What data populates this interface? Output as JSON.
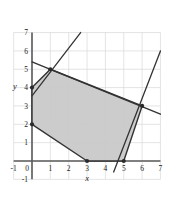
{
  "chart_data": {
    "type": "scatter",
    "title": "",
    "xlabel": "x",
    "ylabel": "y",
    "xlim": [
      -1,
      7
    ],
    "ylim": [
      -1,
      7
    ],
    "xticks": [
      -1,
      0,
      1,
      2,
      3,
      4,
      5,
      6,
      7
    ],
    "yticks": [
      -1,
      0,
      1,
      2,
      3,
      4,
      5,
      6,
      7
    ],
    "xtick_labels": [
      "-1",
      "0",
      "1",
      "2",
      "3",
      "4",
      "5",
      "6",
      "7"
    ],
    "ytick_labels": [
      "-1",
      "0",
      "1",
      "2",
      "3",
      "4",
      "5",
      "6",
      "7"
    ],
    "grid": true,
    "legend": "none",
    "shaded_region": {
      "name": "feasible-region",
      "fill_color": "#c9c9c9",
      "edge_color": "#333333",
      "vertices": [
        {
          "x": 0,
          "y": 4
        },
        {
          "x": 1,
          "y": 5
        },
        {
          "x": 6,
          "y": 3
        },
        {
          "x": 5,
          "y": 0
        },
        {
          "x": 3,
          "y": 0
        },
        {
          "x": 0,
          "y": 2
        }
      ]
    },
    "vertex_markers": [
      {
        "x": 0,
        "y": 4
      },
      {
        "x": 1,
        "y": 5
      },
      {
        "x": 6,
        "y": 3
      },
      {
        "x": 5,
        "y": 0
      },
      {
        "x": 3,
        "y": 0
      },
      {
        "x": 0,
        "y": 2
      }
    ],
    "lines": [
      {
        "name": "steep-rising-line-left",
        "from": {
          "x": 0.0,
          "y": 3.55
        },
        "to": {
          "x": 2.65,
          "y": 7.0
        },
        "color": "#333333"
      },
      {
        "name": "shallow-falling-line",
        "from": {
          "x": 0.0,
          "y": 5.4
        },
        "to": {
          "x": 7.0,
          "y": 2.55
        },
        "color": "#333333"
      },
      {
        "name": "steep-rising-line-right",
        "from": {
          "x": 4.45,
          "y": -0.6
        },
        "to": {
          "x": 7.0,
          "y": 6.0
        },
        "color": "#333333"
      }
    ]
  },
  "axes": {
    "x_axis_label": "x",
    "y_axis_label": "y"
  },
  "colors": {
    "background": "#ffffff",
    "grid": "#d8d8d8",
    "axis": "#5a5a5a",
    "line": "#333333",
    "fill": "#c9c9c9",
    "text": "#1a1a1a"
  }
}
